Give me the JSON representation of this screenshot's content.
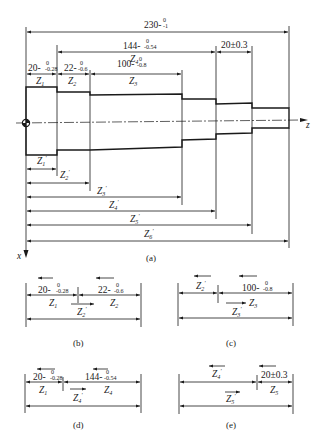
{
  "figure_a": {
    "caption": "(a)",
    "axis_z_label": "z",
    "axis_x_label": "x",
    "dimensions": {
      "overall": {
        "nominal": "230",
        "tol_upper": "0",
        "tol_lower": "-1"
      },
      "z4": {
        "nominal": "144",
        "tol_upper": "0",
        "tol_lower": "-0.54",
        "label": "Z4"
      },
      "z5": {
        "text": "20±0.3"
      },
      "z1": {
        "nominal": "20",
        "tol_upper": "0",
        "tol_lower": "-0.28",
        "label": "Z1"
      },
      "z2": {
        "nominal": "22",
        "tol_upper": "0",
        "tol_lower": "-0.6",
        "label": "Z2"
      },
      "z3": {
        "nominal": "100",
        "tol_upper": "0",
        "tol_lower": "-0.8",
        "label": "Z3"
      }
    },
    "coordinate_labels": [
      "Z1'",
      "Z2'",
      "Z3'",
      "Z4'",
      "Z5'",
      "Z6'"
    ]
  },
  "figure_b": {
    "caption": "(b)",
    "left": {
      "nominal": "20",
      "tol_upper": "0",
      "tol_lower": "-0.28",
      "label": "Z1"
    },
    "right": {
      "nominal": "22",
      "tol_upper": "0",
      "tol_lower": "-0.6",
      "label": "Z2"
    },
    "closing": "Z2'"
  },
  "figure_c": {
    "caption": "(c)",
    "left": {
      "label": "Z2'"
    },
    "right": {
      "nominal": "100",
      "tol_upper": "0",
      "tol_lower": "-0.8",
      "label": "Z3"
    },
    "closing": "Z3'"
  },
  "figure_d": {
    "caption": "(d)",
    "left": {
      "nominal": "20",
      "tol_upper": "0",
      "tol_lower": "-0.28",
      "label": "Z1"
    },
    "right": {
      "nominal": "144",
      "tol_upper": "0",
      "tol_lower": "-0.54",
      "label": "Z4"
    },
    "closing": "Z4'"
  },
  "figure_e": {
    "caption": "(e)",
    "left": {
      "label": "Z4'"
    },
    "right": {
      "text": "20±0.3",
      "label": "Z5"
    },
    "closing": "Z5'"
  }
}
